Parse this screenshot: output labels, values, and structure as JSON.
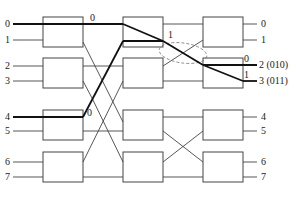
{
  "diagram": {
    "type": "multistage-interconnection-network",
    "colors": {
      "line": "#444444",
      "bold": "#111111",
      "dashed": "#777777",
      "background": "#ffffff"
    },
    "inputs": [
      "0",
      "1",
      "2",
      "3",
      "4",
      "5",
      "6",
      "7"
    ],
    "outputs": [
      "0",
      "1",
      "2 (010)",
      "3 (011)",
      "4",
      "5",
      "6",
      "7"
    ],
    "path_labels": {
      "stage1_out": "0",
      "stage1_in4": "0",
      "stage2_out": "1",
      "stage3_top": "0",
      "stage3_bottom": "1"
    }
  }
}
